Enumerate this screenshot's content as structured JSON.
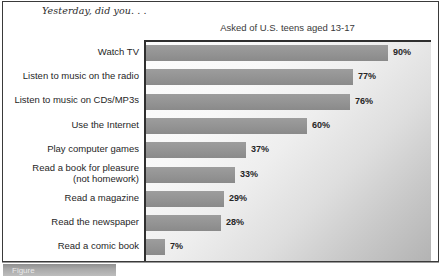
{
  "figure": {
    "header_title": "Yesterday, did you. . .",
    "bottom_tab_label": "Figure"
  },
  "chart_data": {
    "type": "bar",
    "orientation": "horizontal",
    "title": "Asked of U.S. teens aged 13-17",
    "subtitle": "Asked of U.S. teens aged 13-17",
    "xlabel": "",
    "ylabel": "",
    "xlim": [
      0,
      100
    ],
    "grid": false,
    "legend": "none",
    "categories": [
      "Watch TV",
      "Listen to music on the radio",
      "Listen to music on CDs/MP3s",
      "Use the Internet",
      "Play computer games",
      "Read a book for pleasure (not homework)",
      "Read a magazine",
      "Read the newspaper",
      "Read a comic book"
    ],
    "category_lines": [
      [
        "Watch TV"
      ],
      [
        "Listen to music on the radio"
      ],
      [
        "Listen to music on CDs/MP3s"
      ],
      [
        "Use the Internet"
      ],
      [
        "Play computer games"
      ],
      [
        "Read a book for pleasure",
        "(not homework)"
      ],
      [
        "Read a magazine"
      ],
      [
        "Read the newspaper"
      ],
      [
        "Read a comic book"
      ]
    ],
    "values": [
      90,
      77,
      76,
      60,
      37,
      33,
      29,
      28,
      7
    ],
    "value_labels": [
      "90%",
      "77%",
      "76%",
      "60%",
      "37%",
      "33%",
      "29%",
      "28%",
      "7%"
    ],
    "bar_color": "#939393",
    "plot_background_light": "#fdfdfd",
    "plot_background_dark": "#b3b3b3",
    "axis_color": "#2f2f2f"
  }
}
